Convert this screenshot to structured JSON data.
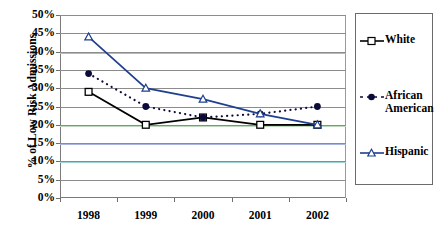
{
  "title_strip": {
    "text": "· · · ·"
  },
  "chart_data": {
    "type": "line",
    "title": "",
    "xlabel": "",
    "ylabel": "% of Low Risk Admissions",
    "categories": [
      "1998",
      "1999",
      "2000",
      "2001",
      "2002"
    ],
    "ylim": [
      0,
      50
    ],
    "ytick_labels": [
      "0%",
      "5%",
      "10%",
      "15%",
      "20%",
      "25%",
      "30%",
      "35%",
      "40%",
      "45%",
      "50%"
    ],
    "ytick_values": [
      0,
      5,
      10,
      15,
      20,
      25,
      30,
      35,
      40,
      45,
      50
    ],
    "grid": true,
    "legend_position": "right",
    "series": [
      {
        "name": "White",
        "legend_label": "White",
        "marker": "open-square",
        "line_style": "solid",
        "color": "#000000",
        "values": [
          29,
          20,
          22,
          20,
          20
        ]
      },
      {
        "name": "African American",
        "legend_label": "African\nAmerican",
        "marker": "filled-circle",
        "line_style": "dotted",
        "color": "#0b0b3b",
        "values": [
          34,
          25,
          22,
          23,
          25
        ]
      },
      {
        "name": "Hispanic",
        "legend_label": "Hispanic",
        "marker": "open-triangle",
        "line_style": "solid",
        "color": "#1f3f8f",
        "values": [
          44,
          30,
          27,
          23,
          20
        ]
      }
    ]
  },
  "colors": {
    "axis": "#7a7a7a",
    "grid": "#8c8c8c",
    "grid_accent_40": "#d9a6c0",
    "grid_accent_20": "#bcd9bc",
    "grid_accent_15": "#a8b6e0",
    "grid_accent_10": "#9fd2d2",
    "legend_border": "#6b6b6b"
  }
}
